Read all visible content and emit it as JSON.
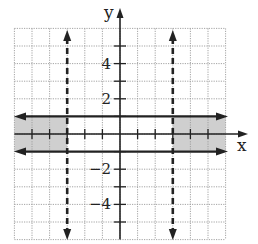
{
  "chart_data": {
    "type": "region",
    "title": "",
    "xlabel": "x",
    "ylabel": "y",
    "xlim": [
      -6,
      6
    ],
    "ylim": [
      -6,
      6
    ],
    "grid": true,
    "grid_step": 1,
    "y_tick_labels": [
      {
        "value": 4,
        "label": "4"
      },
      {
        "value": 2,
        "label": "2"
      },
      {
        "value": -2,
        "label": "−2"
      },
      {
        "value": -4,
        "label": "−4"
      }
    ],
    "boundaries": [
      {
        "type": "vertical",
        "x": -3,
        "style": "dashed",
        "equation": "x = -3"
      },
      {
        "type": "vertical",
        "x": 3,
        "style": "dashed",
        "equation": "x = 3"
      },
      {
        "type": "horizontal",
        "y": 1,
        "style": "solid",
        "equation": "y = 1"
      },
      {
        "type": "horizontal",
        "y": -1,
        "style": "solid",
        "equation": "y = -1"
      }
    ],
    "shaded_regions": [
      {
        "x": [
          -6,
          -3
        ],
        "y": [
          -1,
          1
        ]
      },
      {
        "x": [
          3,
          6
        ],
        "y": [
          -1,
          1
        ]
      }
    ]
  },
  "labels": {
    "x_axis": "x",
    "y_axis": "y"
  },
  "colors": {
    "shade": "#cfcfcf",
    "grid": "#9a9a9a",
    "ink": "#222222"
  }
}
